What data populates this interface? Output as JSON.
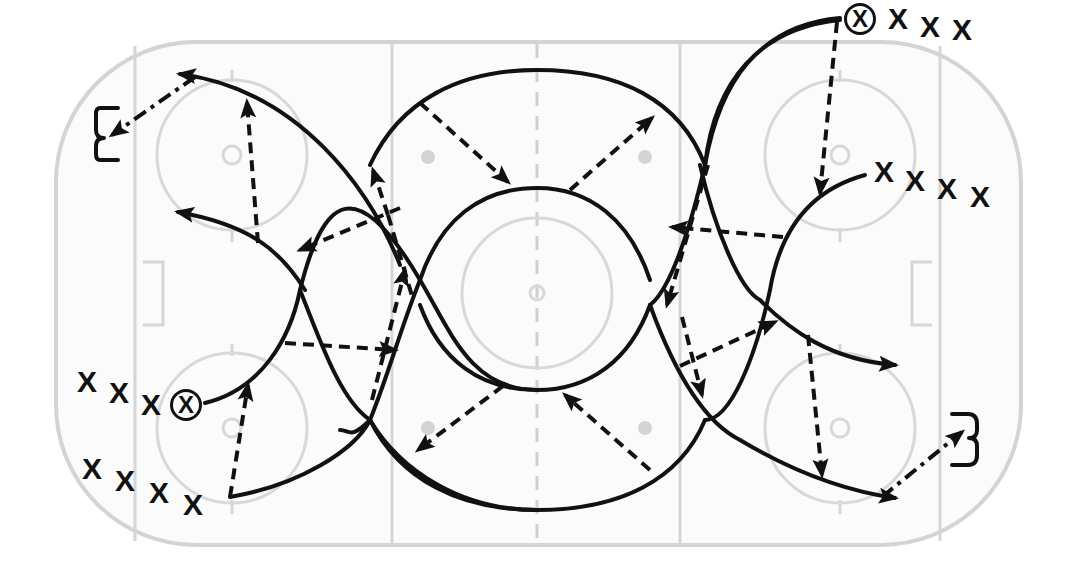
{
  "diagram": {
    "type": "hockey-drill",
    "colors": {
      "ink": "#111111",
      "rink_lines": "#d6d6d6",
      "rink_fill": "#fbfbfb"
    },
    "legend_semantics": {
      "solid_arrow": "skate",
      "dashed_arrow": "pass",
      "dash_dot_arrow": "shot"
    },
    "players": {
      "left_top_line": {
        "carrier": "X",
        "others": [
          "X",
          "X",
          "X"
        ]
      },
      "left_bottom_line": {
        "others": [
          "X",
          "X",
          "X",
          "X"
        ]
      },
      "right_top_line": {
        "carrier": "X",
        "others": [
          "X",
          "X",
          "X"
        ]
      },
      "right_inner_line": {
        "others": [
          "X",
          "X",
          "X",
          "X"
        ]
      }
    },
    "goalie_marks": [
      "left-net-target",
      "right-net-target"
    ]
  }
}
